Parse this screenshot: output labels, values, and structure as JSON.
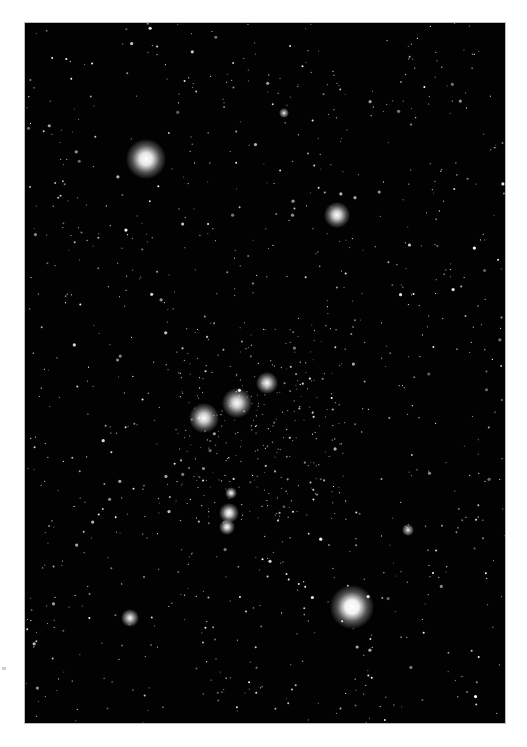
{
  "scene": {
    "subject": "Orion constellation star field",
    "background_color": "#020202",
    "frame_color": "#ffffff",
    "star_color": "#ffffff",
    "field_star_count": 900
  },
  "bright_stars": [
    {
      "name": "betelgeuse",
      "x": 121,
      "y": 136,
      "size": 40,
      "glow": 0.9
    },
    {
      "name": "bellatrix",
      "x": 312,
      "y": 192,
      "size": 26,
      "glow": 0.8
    },
    {
      "name": "belt-west",
      "x": 179,
      "y": 395,
      "size": 30,
      "glow": 0.8
    },
    {
      "name": "belt-middle",
      "x": 212,
      "y": 380,
      "size": 30,
      "glow": 0.8
    },
    {
      "name": "belt-east",
      "x": 242,
      "y": 360,
      "size": 22,
      "glow": 0.75
    },
    {
      "name": "sword-upper",
      "x": 206,
      "y": 470,
      "size": 12,
      "glow": 0.7
    },
    {
      "name": "sword-middle",
      "x": 204,
      "y": 490,
      "size": 20,
      "glow": 0.8
    },
    {
      "name": "sword-lower",
      "x": 202,
      "y": 504,
      "size": 16,
      "glow": 0.75
    },
    {
      "name": "rigel",
      "x": 327,
      "y": 584,
      "size": 44,
      "glow": 0.95
    },
    {
      "name": "saiph",
      "x": 105,
      "y": 595,
      "size": 18,
      "glow": 0.7
    },
    {
      "name": "head-meissa",
      "x": 259,
      "y": 90,
      "size": 10,
      "glow": 0.6
    },
    {
      "name": "right-star",
      "x": 383,
      "y": 507,
      "size": 12,
      "glow": 0.6
    }
  ]
}
